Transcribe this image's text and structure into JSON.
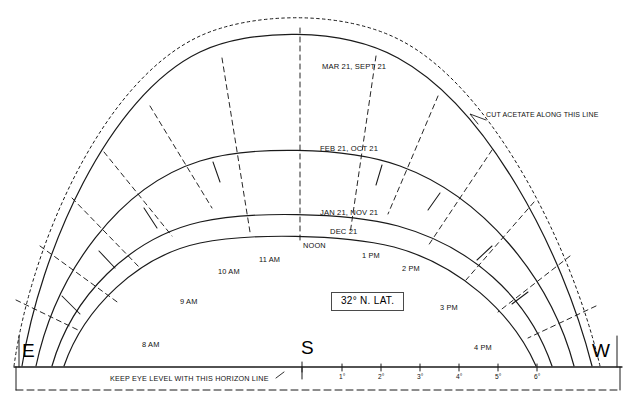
{
  "diagram": {
    "title_box": "32° N. LAT.",
    "compass": {
      "east": "E",
      "south": "S",
      "west": "W"
    },
    "season_curves": [
      {
        "id": "mar-sept",
        "label": "MAR 21, SEPT 21"
      },
      {
        "id": "feb-oct",
        "label": "FEB 21, OCT 21"
      },
      {
        "id": "jan-nov",
        "label": "JAN 21, NOV 21"
      },
      {
        "id": "dec",
        "label": "DEC 21"
      }
    ],
    "hour_labels": [
      {
        "id": "8am",
        "label": "8 AM"
      },
      {
        "id": "9am",
        "label": "9 AM"
      },
      {
        "id": "10am",
        "label": "10 AM"
      },
      {
        "id": "11am",
        "label": "11 AM"
      },
      {
        "id": "noon",
        "label": "NOON"
      },
      {
        "id": "1pm",
        "label": "1 PM"
      },
      {
        "id": "2pm",
        "label": "2 PM"
      },
      {
        "id": "3pm",
        "label": "3 PM"
      },
      {
        "id": "4pm",
        "label": "4 PM"
      }
    ],
    "annotations": {
      "cut_line": "CUT ACETATE ALONG THIS LINE",
      "horizon_line": "KEEP EYE LEVEL WITH THIS HORIZON LINE"
    },
    "degree_scale": [
      {
        "label": "1°"
      },
      {
        "label": "2°"
      },
      {
        "label": "3°"
      },
      {
        "label": "4°"
      },
      {
        "label": "5°"
      },
      {
        "label": "6°"
      }
    ],
    "colors": {
      "ink": "#1a1a1a",
      "paper": "#ffffff",
      "box_border": "#4a4a4a"
    }
  }
}
